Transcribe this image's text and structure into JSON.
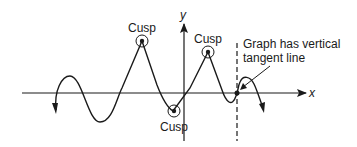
{
  "diagram": {
    "type": "function-graph",
    "axes": {
      "x_label": "x",
      "y_label": "y"
    },
    "cusps": [
      {
        "label": "Cusp",
        "position": "local maximum left of y-axis"
      },
      {
        "label": "Cusp",
        "position": "local minimum near y-axis"
      },
      {
        "label": "Cusp",
        "position": "local maximum right of y-axis"
      }
    ],
    "annotation": {
      "line1": "Graph has vertical",
      "line2": "tangent line"
    },
    "colors": {
      "stroke": "#1a1a1a",
      "background": "#ffffff"
    }
  }
}
